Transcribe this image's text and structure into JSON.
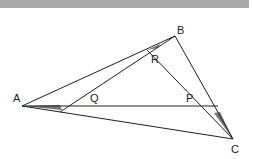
{
  "figure": {
    "type": "geometry",
    "header_bar_color": "#a8a8a8",
    "line_color": "#222222",
    "shade_color": "#777777",
    "points": {
      "A": {
        "label": "A",
        "x": 22,
        "y": 106
      },
      "B": {
        "label": "B",
        "x": 175,
        "y": 36
      },
      "C": {
        "label": "C",
        "x": 233,
        "y": 139
      },
      "R": {
        "label": "R",
        "x": 147,
        "y": 50
      },
      "Q": {
        "label": "Q",
        "x": 62,
        "y": 106
      },
      "P": {
        "label": "P",
        "x": 207,
        "y": 106
      }
    },
    "labels": {
      "A": "A",
      "B": "B",
      "C": "C",
      "R": "R",
      "Q": "Q",
      "P": "P"
    }
  }
}
